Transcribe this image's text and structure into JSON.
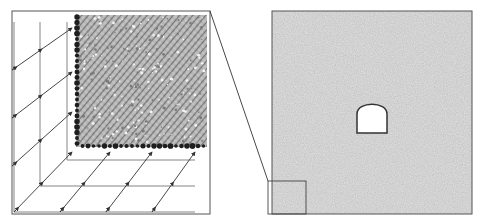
{
  "figure": {
    "description": "Particle model schematic: zoomed corner with boundary particles and loading arrows (left) and full model with arch-shaped tunnel opening (right)",
    "colors": {
      "frame": "#555555",
      "particle_fill": "#b8b8b8",
      "particle_hatch": "#8a8a8a",
      "boundary_particle": "#1e1e1e",
      "grid_line": "#777777",
      "arrow": "#333333",
      "model_fill": "#c4c4c4",
      "tunnel_fill": "#ffffff",
      "tunnel_outline": "#333333",
      "background": "#ffffff"
    },
    "left_panel": {
      "name": "zoomed-corner-detail",
      "frame": {
        "x": 12,
        "y": 11,
        "w": 198,
        "h": 203
      },
      "particle_region": {
        "x": 76,
        "y": 15,
        "w": 131,
        "h": 132
      },
      "boundary_particles": {
        "left_column_x": 77,
        "bottom_row_y": 146,
        "spacing": 5.5
      },
      "grid_vertical_x": [
        14,
        40,
        67
      ],
      "grid_horizontal_y": [
        160,
        186,
        212
      ],
      "left_arrows": [
        {
          "x1": 12,
          "y1": 70,
          "x2": 72,
          "y2": 28
        },
        {
          "x1": 12,
          "y1": 118,
          "x2": 72,
          "y2": 72
        },
        {
          "x1": 12,
          "y1": 166,
          "x2": 72,
          "y2": 112
        },
        {
          "x1": 14,
          "y1": 212,
          "x2": 72,
          "y2": 152
        }
      ],
      "bottom_arrows": [
        {
          "x1": 60,
          "y1": 212,
          "x2": 110,
          "y2": 152
        },
        {
          "x1": 106,
          "y1": 212,
          "x2": 152,
          "y2": 152
        },
        {
          "x1": 152,
          "y1": 212,
          "x2": 195,
          "y2": 152
        }
      ]
    },
    "connector_line": {
      "x1": 210,
      "y1": 11,
      "x2": 268,
      "y2": 181
    },
    "right_panel": {
      "name": "full-model",
      "frame": {
        "x": 272,
        "y": 11,
        "w": 200,
        "h": 203
      },
      "inset_box": {
        "x": 268,
        "y": 181,
        "w": 38,
        "h": 33
      },
      "tunnel": {
        "x": 357,
        "y_top": 102,
        "w": 30,
        "y_spring": 114,
        "y_bottom": 133
      }
    }
  }
}
